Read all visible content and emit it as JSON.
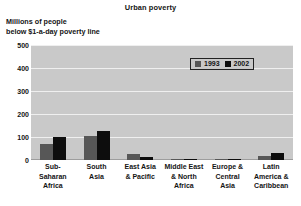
{
  "chart_data": {
    "type": "bar",
    "title": "Urban poverty",
    "ylabel_lines": [
      "Millions of people",
      "below $1-a-day poverty line"
    ],
    "xlabel": "",
    "ylim": [
      0,
      500
    ],
    "yticks": [
      500,
      400,
      300,
      200,
      100,
      0
    ],
    "ytick_labels": [
      "500",
      "400",
      "300",
      "200",
      "100",
      "0"
    ],
    "grid": true,
    "legend_position": "upper right",
    "categories": [
      "Sub-Saharan Africa",
      "South Asia",
      "East Asia & Pacific",
      "Middle East & North Africa",
      "Europe & Central Asia",
      "Latin America & Caribbean"
    ],
    "category_lines": [
      [
        "Sub-",
        "Saharan",
        "Africa"
      ],
      [
        "South",
        "Asia"
      ],
      [
        "East Asia",
        "& Pacific"
      ],
      [
        "Middle East",
        "& North",
        "Africa"
      ],
      [
        "Europe &",
        "Central",
        "Asia"
      ],
      [
        "Latin",
        "America &",
        "Caribbean"
      ]
    ],
    "series": [
      {
        "name": "1993",
        "color": "#575757",
        "values": [
          68,
          105,
          27,
          4,
          3,
          18
        ]
      },
      {
        "name": "2002",
        "color": "#0d0d0d",
        "values": [
          98,
          125,
          15,
          5,
          4,
          30
        ]
      }
    ],
    "colors": {
      "plot_background": "#c9c9c9",
      "gridline": "#efefef",
      "axis": "#9d9d9d",
      "text": "#141414",
      "page_background": "#ffffff"
    }
  },
  "legend": {
    "entries": [
      {
        "label": "1993"
      },
      {
        "label": "2002"
      }
    ]
  }
}
